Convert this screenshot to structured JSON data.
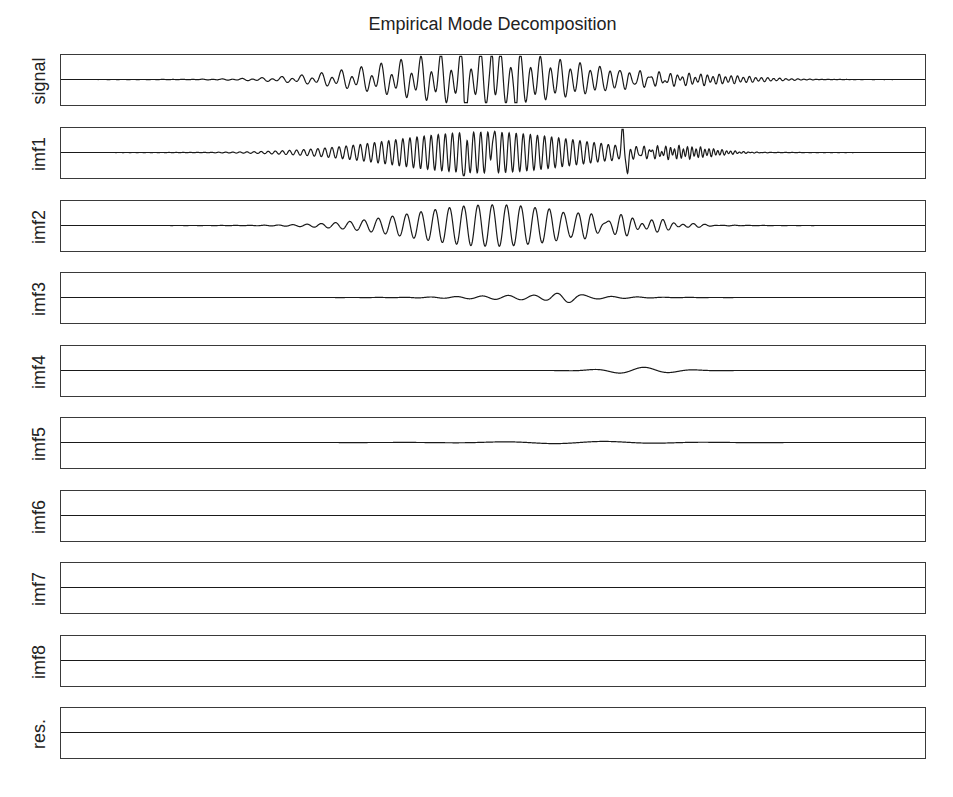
{
  "chart_data": {
    "type": "line",
    "title": "Empirical Mode Decomposition",
    "xlabel": "",
    "ylabel": "",
    "grid": false,
    "legend": null,
    "layout": "10 vertically stacked panels sharing x-axis, no tick labels",
    "panels": [
      {
        "label": "signal",
        "description": "chirp-like burst; envelope grows from x~0.12, peaks near x~0.52, decays to ~0.85; large spikes near x~0.47 and x~0.53",
        "components": [
          {
            "center": 0.5,
            "width": 0.16,
            "amp": 0.85,
            "period": 0.0115
          },
          {
            "center": 0.46,
            "width": 0.14,
            "amp": 0.45,
            "period": 0.023
          },
          {
            "center": 0.74,
            "width": 0.08,
            "amp": 0.18,
            "period": 0.007
          }
        ],
        "spikes": [
          {
            "x": 0.468,
            "amp": -0.95
          },
          {
            "x": 0.499,
            "amp": 0.95
          },
          {
            "x": 0.527,
            "amp": -0.95
          }
        ]
      },
      {
        "label": "imf1",
        "description": "high-frequency oscillation, amplitude builds from x~0.1, near full scale 0.35-0.65, transient at x~0.65, then fast low-amplitude ripple to ~0.87",
        "components": [
          {
            "center": 0.49,
            "width": 0.15,
            "amp": 0.88,
            "period": 0.0082
          },
          {
            "center": 0.72,
            "width": 0.05,
            "amp": 0.22,
            "period": 0.005
          }
        ],
        "spikes": [
          {
            "x": 0.468,
            "amp": -0.95
          },
          {
            "x": 0.499,
            "amp": 0.95
          },
          {
            "x": 0.65,
            "amp": 0.9
          },
          {
            "x": 0.656,
            "amp": -0.9
          }
        ]
      },
      {
        "label": "imf2",
        "description": "lower-frequency oscillation, envelope from x~0.15, peak near x~0.52, decaying to ~0.87",
        "components": [
          {
            "center": 0.5,
            "width": 0.13,
            "amp": 0.9,
            "period": 0.0165
          },
          {
            "center": 0.66,
            "width": 0.06,
            "amp": 0.25,
            "period": 0.012
          }
        ],
        "spikes": []
      },
      {
        "label": "imf3",
        "description": "small ripple, largest near x~0.56-0.59",
        "components": [
          {
            "center": 0.55,
            "width": 0.1,
            "amp": 0.1,
            "period": 0.03
          },
          {
            "center": 0.585,
            "width": 0.02,
            "amp": 0.18,
            "period": 0.03
          }
        ],
        "spikes": []
      },
      {
        "label": "imf4",
        "description": "slow small wave between x~0.55 and x~0.78",
        "components": [
          {
            "center": 0.67,
            "width": 0.05,
            "amp": 0.14,
            "period": 0.06
          }
        ],
        "spikes": []
      },
      {
        "label": "imf5",
        "description": "nearly flat, very slight undulation",
        "components": [
          {
            "center": 0.6,
            "width": 0.12,
            "amp": 0.05,
            "period": 0.12
          }
        ],
        "spikes": []
      },
      {
        "label": "imf6",
        "description": "flat",
        "components": [],
        "spikes": []
      },
      {
        "label": "imf7",
        "description": "flat",
        "components": [],
        "spikes": []
      },
      {
        "label": "imf8",
        "description": "flat",
        "components": [],
        "spikes": []
      },
      {
        "label": "res.",
        "description": "flat residue",
        "components": [],
        "spikes": []
      }
    ],
    "x_range": [
      0,
      1
    ],
    "y_range_per_panel": [
      -1,
      1
    ]
  },
  "style": {
    "line_color": "#1a1a1a",
    "frame_color": "#3a3a3a"
  }
}
